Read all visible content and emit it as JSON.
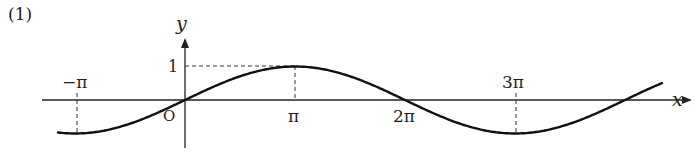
{
  "problem_label": "(1)",
  "chart_data": {
    "type": "line",
    "title": "",
    "xlabel": "x",
    "ylabel": "y",
    "function": "y = sin(x/2)",
    "period": "4π",
    "origin_label": "O",
    "x_ticks": [
      {
        "label": "−π",
        "value": -3.14159
      },
      {
        "label": "π",
        "value": 3.14159
      },
      {
        "label": "2π",
        "value": 6.28319
      },
      {
        "label": "3π",
        "value": 9.42478
      }
    ],
    "y_ticks": [
      {
        "label": "1",
        "value": 1
      }
    ],
    "key_points": [
      {
        "x": "−π",
        "y": -1
      },
      {
        "x": "0",
        "y": 0
      },
      {
        "x": "π",
        "y": 1
      },
      {
        "x": "2π",
        "y": 0
      },
      {
        "x": "3π",
        "y": -1
      }
    ],
    "xlim": [
      -3.9,
      12.0
    ],
    "ylim": [
      -1.2,
      1.2
    ],
    "grid": false,
    "legend": null
  },
  "colors": {
    "curve": "#111111",
    "axes": "#222222",
    "dashed": "#333333"
  }
}
